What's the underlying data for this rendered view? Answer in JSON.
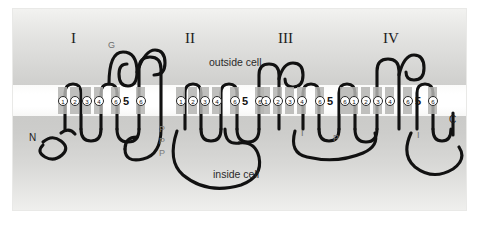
{
  "figure": {
    "membrane_labels": {
      "outside": "outside cell",
      "inside": "inside cell"
    },
    "termini": {
      "n_terminus": "N",
      "c_terminus": "C"
    },
    "colors": {
      "background_top": "#f2f2f0",
      "background_mid": "#c9c9c7",
      "membrane": "#ffffff",
      "chain": "#111111",
      "helix_box": "#b4b4b2",
      "label_text": "#2a2a2a",
      "marker_text": "#7b7b7b"
    },
    "domains": [
      {
        "name": "I",
        "segments": [
          "1",
          "2",
          "3",
          "4",
          "6",
          "5",
          "6"
        ],
        "segment_numbers": [
          "1",
          "2",
          "3",
          "4",
          "6"
        ],
        "pore_label": "5",
        "markers": [
          {
            "type": "glycosylation",
            "label": "G"
          }
        ]
      },
      {
        "name": "II",
        "segments": [
          "1",
          "2",
          "3",
          "4",
          "6",
          "5",
          "6"
        ],
        "segment_numbers": [
          "1",
          "2",
          "3",
          "4",
          "6"
        ],
        "pore_label": "5",
        "markers": [
          {
            "type": "phosphorylation",
            "label": "P"
          },
          {
            "type": "phosphorylation",
            "label": "P"
          },
          {
            "type": "phosphorylation",
            "label": "P"
          }
        ]
      },
      {
        "name": "III",
        "segments": [
          "1",
          "2",
          "3",
          "4",
          "6",
          "5",
          "6"
        ],
        "segment_numbers": [
          "1",
          "2",
          "3",
          "4",
          "6"
        ],
        "pore_label": "5",
        "markers": [
          {
            "type": "inactivation",
            "label": "I"
          },
          {
            "type": "phosphorylation",
            "label": "P"
          }
        ]
      },
      {
        "name": "IV",
        "segments": [
          "1",
          "2",
          "3",
          "4",
          "6",
          "5",
          "6"
        ],
        "segment_numbers": [
          "1",
          "2",
          "3",
          "4",
          "6"
        ],
        "pore_label": "5",
        "markers": [
          {
            "type": "inactivation",
            "label": "I"
          }
        ]
      }
    ]
  }
}
